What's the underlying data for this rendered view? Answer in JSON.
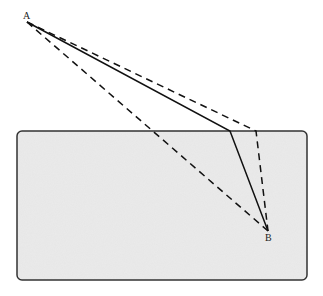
{
  "diagram": {
    "points": {
      "A": {
        "label": "A",
        "x": 27,
        "y": 22
      },
      "B": {
        "label": "B",
        "x": 268,
        "y": 231
      }
    },
    "obstacle": {
      "x": 17,
      "y": 131,
      "width": 290,
      "height": 149,
      "radius": 5,
      "fill": "#e6e6e6",
      "stroke": "#333333"
    },
    "paths": [
      {
        "name": "solid-path",
        "style": "solid",
        "points": [
          [
            27,
            22
          ],
          [
            230,
            131
          ],
          [
            268,
            231
          ]
        ]
      },
      {
        "name": "dashed-path-over-corner",
        "style": "dashed",
        "points": [
          [
            27,
            22
          ],
          [
            256,
            131
          ],
          [
            268,
            231
          ]
        ]
      },
      {
        "name": "dashed-path-direct",
        "style": "dashed",
        "points": [
          [
            27,
            22
          ],
          [
            268,
            231
          ]
        ]
      }
    ]
  }
}
